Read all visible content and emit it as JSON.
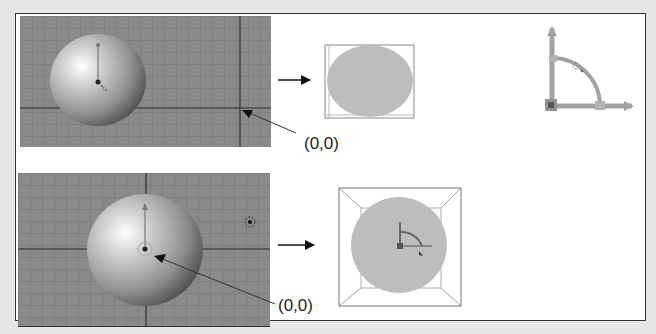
{
  "figure": {
    "rows": [
      {
        "id": "top",
        "viewport": {
          "grid_color": "#8a8a8a",
          "object": "sphere",
          "origin_marker": "corner-crosshair"
        },
        "arrow": "right-arrow",
        "render_preview": {
          "shape": "ellipse",
          "fill": "#bdbdbd"
        },
        "origin_label": "(0,0)"
      },
      {
        "id": "bottom",
        "viewport": {
          "grid_color": "#8a8a8a",
          "object": "sphere",
          "origin_marker": "sphere-center",
          "lamp": "lamp-icon"
        },
        "arrow": "right-arrow",
        "render_preview": {
          "shape": "circle-in-frustum",
          "fill": "#bdbdbd",
          "gizmo": "rotation-gizmo"
        },
        "origin_label": "(0,0)"
      }
    ],
    "gizmo": {
      "type": "rotation-quarter-arc",
      "color": "#8c8c8c"
    }
  }
}
